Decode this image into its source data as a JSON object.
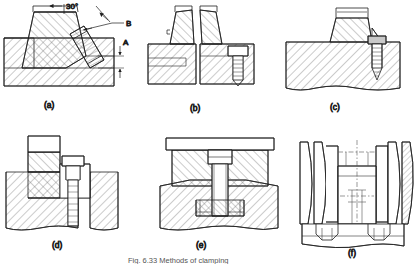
{
  "figure": {
    "title": "Fig. 6.33 Methods of clamping",
    "background_color": "#ffffff",
    "line_color": "#1e1e1e",
    "hatch_color": "#6a6a6a",
    "caption_color": "#3a3a3a"
  },
  "panels": [
    {
      "id": "a",
      "label": "(a)",
      "description": "Inclined wedge clamp against stepped block, angle and dimension annotated"
    },
    {
      "id": "b",
      "label": "(b)",
      "description": "Pair of opposed tapered clamps with hex bolt in right block"
    },
    {
      "id": "c",
      "label": "(c)",
      "description": "Trapezoidal block seated in base, secured by side bolt"
    },
    {
      "id": "d",
      "label": "(d)",
      "description": "Stepped T-block clamped to base by socket head bolt"
    },
    {
      "id": "e",
      "label": "(e)",
      "description": "Flat plate clamp over base with central through bolt"
    },
    {
      "id": "f",
      "label": "(f)",
      "description": "Twin grooved pulley/wheel assembly on shaft, sectioned"
    }
  ],
  "annotations": {
    "angle": "30°",
    "leader_b": "B",
    "dimension_a": "A"
  }
}
